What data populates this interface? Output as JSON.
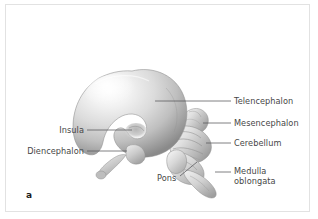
{
  "figure": {
    "panel_letter": "a",
    "background_color": "#ffffff",
    "border_color": "#e2e2e2",
    "text_color": "#474747",
    "leader_line_color": "#56565a",
    "illustration_subject": "fetal-brain-lateral-view"
  },
  "labels": [
    {
      "id": "telencephalon",
      "text": "Telencephalon",
      "side": "right",
      "text_x": 234,
      "text_y": 97,
      "leader": {
        "x1": 155,
        "y1": 101,
        "x2": 231,
        "y2": 101
      }
    },
    {
      "id": "mesencephalon",
      "text": "Mesencephalon",
      "side": "right",
      "text_x": 234,
      "text_y": 119,
      "leader": {
        "x1": 203,
        "y1": 123,
        "x2": 231,
        "y2": 123
      }
    },
    {
      "id": "cerebellum",
      "text": "Cerebellum",
      "side": "right",
      "text_x": 234,
      "text_y": 139,
      "leader": {
        "x1": 206,
        "y1": 143,
        "x2": 231,
        "y2": 143
      }
    },
    {
      "id": "medulla-oblongata",
      "text": "Medulla",
      "text_line2": "oblongata",
      "side": "right",
      "text_x": 234,
      "text_y": 167,
      "leader": {
        "x1": 215,
        "y1": 172,
        "x2": 231,
        "y2": 172
      }
    },
    {
      "id": "insula",
      "text": "Insula",
      "side": "left",
      "text_right": 84,
      "text_y": 126,
      "leader": {
        "x1": 87,
        "y1": 130,
        "x2": 132,
        "y2": 130
      }
    },
    {
      "id": "diencephalon",
      "text": "Diencephalon",
      "side": "left",
      "text_right": 84,
      "text_y": 147,
      "leader": {
        "x1": 87,
        "y1": 151,
        "x2": 127,
        "y2": 151
      }
    },
    {
      "id": "pons",
      "text": "Pons",
      "side": "bottom",
      "text_x": 157,
      "text_y": 174,
      "leader": {
        "x1": 180,
        "y1": 176,
        "x2": 197,
        "y2": 162
      }
    }
  ],
  "structures": {
    "cerebrum": "telencephalon-hemisphere",
    "insula_notch": "insula-depression",
    "stalk": "olfactory-optic-stalk",
    "midbrain": "mesencephalon-lobe",
    "cerebellum": "cerebellum-folia",
    "pons": "pons-bulge",
    "medulla": "medulla-oblongata-taper"
  }
}
